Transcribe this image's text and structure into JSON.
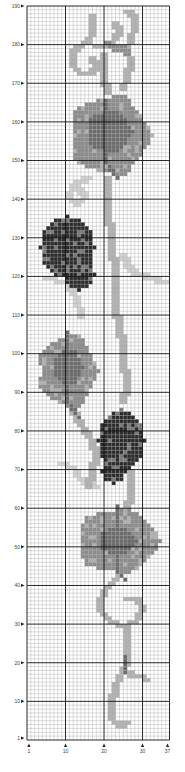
{
  "chart_data": {
    "type": "heatmap",
    "title": "",
    "columns": 37,
    "rows": 190,
    "x_tick_labels": [
      "1",
      "10",
      "20",
      "30",
      "37"
    ],
    "x_tick_values": [
      1,
      10,
      20,
      30,
      37
    ],
    "y_tick_labels": [
      "190",
      "180",
      "170",
      "160",
      "150",
      "140",
      "130",
      "120",
      "110",
      "100",
      "90",
      "80",
      "70",
      "60",
      "50",
      "40",
      "30",
      "20",
      "10",
      "1"
    ],
    "y_tick_values": [
      190,
      180,
      170,
      160,
      150,
      140,
      130,
      120,
      110,
      100,
      90,
      80,
      70,
      60,
      50,
      40,
      30,
      20,
      10,
      1
    ],
    "bold_line_every": 10,
    "palette": {
      "background": "#ffffff",
      "grid_minor": "#9a9a9a",
      "grid_major": "#111111",
      "very_light": "#d2d2d2",
      "light": "#b2b2b2",
      "medium": "#8c8c8c",
      "dark": "#6a6a6a",
      "grape": "#2b2b2b",
      "grape_highlight": "#7a7a7a"
    },
    "shapes": [
      {
        "kind": "tendril",
        "color": "light",
        "points": [
          [
            17,
            188
          ],
          [
            17,
            184
          ],
          [
            16,
            181
          ],
          [
            13,
            180
          ],
          [
            12,
            178
          ],
          [
            12,
            175
          ],
          [
            14,
            173
          ],
          [
            17,
            173
          ],
          [
            18,
            175
          ],
          [
            17,
            177
          ]
        ]
      },
      {
        "kind": "tendril",
        "color": "light",
        "points": [
          [
            18,
            180
          ],
          [
            21,
            180
          ],
          [
            23,
            182
          ],
          [
            24,
            184
          ],
          [
            23,
            186
          ]
        ]
      },
      {
        "kind": "tendril",
        "color": "light",
        "points": [
          [
            26,
            189
          ],
          [
            28,
            188
          ],
          [
            28,
            185
          ],
          [
            27,
            182
          ],
          [
            26,
            179
          ],
          [
            27,
            176
          ],
          [
            26,
            172
          ],
          [
            25,
            169
          ]
        ]
      },
      {
        "kind": "tendril",
        "color": "medium",
        "points": [
          [
            21,
            181
          ],
          [
            23,
            179
          ],
          [
            25,
            180
          ],
          [
            26,
            178
          ]
        ]
      },
      {
        "kind": "tendril",
        "color": "light",
        "points": [
          [
            20,
            178
          ],
          [
            20,
            172
          ],
          [
            21,
            168
          ]
        ]
      },
      {
        "kind": "leaf",
        "color": "medium",
        "cx": 22,
        "cy": 157,
        "rx": 11,
        "ry": 11
      },
      {
        "kind": "leaf",
        "color": "dark",
        "cx": 22,
        "cy": 158,
        "rx": 6,
        "ry": 6
      },
      {
        "kind": "vein",
        "color": "dark",
        "points": [
          [
            21,
            166
          ],
          [
            21,
            150
          ],
          [
            24,
            146
          ]
        ]
      },
      {
        "kind": "tendril",
        "color": "very_light",
        "points": [
          [
            16,
            146
          ],
          [
            12,
            144
          ],
          [
            11,
            141
          ],
          [
            13,
            139
          ],
          [
            15,
            141
          ],
          [
            14,
            143
          ]
        ]
      },
      {
        "kind": "tendril",
        "color": "light",
        "points": [
          [
            21,
            146
          ],
          [
            21,
            138
          ],
          [
            22,
            130
          ],
          [
            23,
            120
          ],
          [
            23,
            110
          ]
        ]
      },
      {
        "kind": "tendril",
        "color": "very_light",
        "points": [
          [
            5,
            120
          ],
          [
            10,
            119
          ],
          [
            13,
            115
          ],
          [
            14,
            110
          ]
        ]
      },
      {
        "kind": "tendril",
        "color": "very_light",
        "points": [
          [
            25,
            126
          ],
          [
            27,
            122
          ],
          [
            32,
            120
          ],
          [
            36,
            119
          ]
        ]
      },
      {
        "kind": "grapes",
        "color": "grape",
        "cx": 11,
        "cy": 128,
        "rx": 7,
        "ry": 8
      },
      {
        "kind": "grapes",
        "color": "grape",
        "cx": 14,
        "cy": 121,
        "rx": 4,
        "ry": 4
      },
      {
        "kind": "leaf",
        "color": "medium",
        "cx": 11,
        "cy": 96,
        "rx": 8,
        "ry": 10
      },
      {
        "kind": "leaf",
        "color": "dark",
        "cx": 11,
        "cy": 97,
        "rx": 4,
        "ry": 5
      },
      {
        "kind": "vein",
        "color": "dark",
        "points": [
          [
            11,
            106
          ],
          [
            11,
            88
          ],
          [
            14,
            84
          ]
        ]
      },
      {
        "kind": "tendril",
        "color": "light",
        "points": [
          [
            12,
            86
          ],
          [
            14,
            82
          ],
          [
            17,
            78
          ],
          [
            18,
            74
          ],
          [
            17,
            70
          ],
          [
            16,
            66
          ]
        ]
      },
      {
        "kind": "tendril",
        "color": "light",
        "points": [
          [
            24,
            110
          ],
          [
            25,
            100
          ],
          [
            26,
            92
          ],
          [
            25,
            88
          ]
        ]
      },
      {
        "kind": "tendril",
        "color": "very_light",
        "points": [
          [
            9,
            72
          ],
          [
            12,
            71
          ],
          [
            14,
            68
          ],
          [
            18,
            66
          ]
        ]
      },
      {
        "kind": "grapes",
        "color": "grape",
        "cx": 25,
        "cy": 78,
        "rx": 6,
        "ry": 8
      },
      {
        "kind": "grapes",
        "color": "grape",
        "cx": 23,
        "cy": 70,
        "rx": 3,
        "ry": 3
      },
      {
        "kind": "tendril",
        "color": "light",
        "points": [
          [
            27,
            70
          ],
          [
            27,
            64
          ],
          [
            26,
            60
          ]
        ]
      },
      {
        "kind": "leaf",
        "color": "medium",
        "cx": 24,
        "cy": 52,
        "rx": 11,
        "ry": 9
      },
      {
        "kind": "leaf",
        "color": "dark",
        "cx": 24,
        "cy": 52,
        "rx": 5,
        "ry": 4
      },
      {
        "kind": "vein",
        "color": "dark",
        "points": [
          [
            24,
            61
          ],
          [
            24,
            44
          ],
          [
            26,
            42
          ]
        ]
      },
      {
        "kind": "tendril",
        "color": "light",
        "points": [
          [
            24,
            43
          ],
          [
            21,
            40
          ],
          [
            19,
            37
          ],
          [
            19,
            34
          ],
          [
            22,
            31
          ],
          [
            25,
            30
          ],
          [
            28,
            31
          ],
          [
            30,
            34
          ],
          [
            29,
            37
          ],
          [
            26,
            37
          ]
        ]
      },
      {
        "kind": "tendril",
        "color": "light",
        "points": [
          [
            26,
            30
          ],
          [
            26,
            24
          ],
          [
            26,
            20
          ]
        ]
      },
      {
        "kind": "tendril",
        "color": "light",
        "points": [
          [
            26,
            20
          ],
          [
            24,
            17
          ],
          [
            23,
            14
          ],
          [
            22,
            10
          ],
          [
            22,
            6
          ],
          [
            24,
            4
          ],
          [
            26,
            5
          ]
        ]
      },
      {
        "kind": "tendril",
        "color": "light",
        "points": [
          [
            26,
            18
          ],
          [
            28,
            17
          ],
          [
            30,
            17
          ],
          [
            31,
            16
          ]
        ]
      },
      {
        "kind": "vein",
        "color": "dark",
        "points": [
          [
            26,
            22
          ],
          [
            26,
            18
          ]
        ]
      }
    ]
  }
}
